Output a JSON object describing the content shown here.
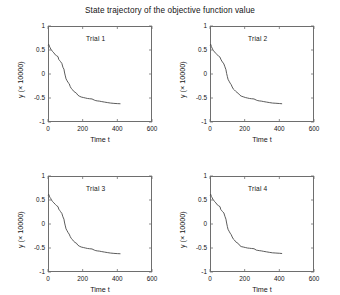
{
  "figure": {
    "title": "State trajectory of the objective function value",
    "background": "#ffffff",
    "axis_color": "#6e6e6e",
    "line_color": "#4a4a4a"
  },
  "axes": {
    "xlabel": "Time t",
    "ylabel": "y (× 10000)",
    "xticks": [
      "0",
      "200",
      "400",
      "600"
    ],
    "xtick_values": [
      0,
      200,
      400,
      600
    ],
    "yticks": [
      "1",
      "0.5",
      "0",
      "-0.5",
      "-1"
    ],
    "ytick_values": [
      1,
      0.5,
      0,
      -0.5,
      -1
    ],
    "xlim": [
      0,
      600
    ],
    "ylim": [
      -1,
      1
    ]
  },
  "chart_data": {
    "type": "line",
    "title": "State trajectory of the objective function value",
    "xlabel": "Time t",
    "ylabel": "y (× 10000)",
    "xlim": [
      0,
      600
    ],
    "ylim": [
      -1,
      1
    ],
    "grid": false,
    "legend": "none",
    "panel_layout": "2x2",
    "panels": [
      {
        "label": "Trial 1",
        "x": [
          0,
          4,
          8,
          12,
          16,
          20,
          26,
          34,
          42,
          50,
          58,
          62,
          68,
          72,
          80,
          86,
          92,
          96,
          100,
          104,
          110,
          116,
          122,
          128,
          134,
          140,
          148,
          156,
          164,
          172,
          180,
          192,
          204,
          216,
          228,
          240,
          254,
          268,
          276,
          284,
          296,
          310,
          326,
          342,
          360,
          380,
          400,
          418
        ],
        "y": [
          0.6,
          0.62,
          0.58,
          0.55,
          0.52,
          0.5,
          0.47,
          0.44,
          0.4,
          0.38,
          0.36,
          0.3,
          0.28,
          0.26,
          0.22,
          0.14,
          0.1,
          0.02,
          -0.04,
          -0.1,
          -0.14,
          -0.18,
          -0.2,
          -0.26,
          -0.3,
          -0.32,
          -0.36,
          -0.38,
          -0.4,
          -0.44,
          -0.46,
          -0.48,
          -0.49,
          -0.5,
          -0.51,
          -0.515,
          -0.52,
          -0.545,
          -0.555,
          -0.56,
          -0.565,
          -0.575,
          -0.585,
          -0.595,
          -0.605,
          -0.612,
          -0.617,
          -0.62
        ]
      },
      {
        "label": "Trial 2",
        "x": [
          0,
          4,
          8,
          12,
          16,
          20,
          26,
          34,
          42,
          50,
          58,
          62,
          68,
          72,
          80,
          86,
          92,
          96,
          100,
          104,
          110,
          116,
          122,
          128,
          134,
          140,
          148,
          156,
          164,
          172,
          180,
          192,
          204,
          216,
          228,
          240,
          254,
          268,
          276,
          284,
          296,
          310,
          326,
          342,
          360,
          380,
          400,
          416
        ],
        "y": [
          0.6,
          0.62,
          0.57,
          0.54,
          0.51,
          0.49,
          0.46,
          0.43,
          0.4,
          0.37,
          0.35,
          0.31,
          0.27,
          0.25,
          0.21,
          0.15,
          0.09,
          0.01,
          -0.05,
          -0.11,
          -0.15,
          -0.19,
          -0.22,
          -0.27,
          -0.31,
          -0.33,
          -0.36,
          -0.385,
          -0.405,
          -0.44,
          -0.46,
          -0.475,
          -0.49,
          -0.5,
          -0.51,
          -0.515,
          -0.52,
          -0.545,
          -0.555,
          -0.56,
          -0.565,
          -0.575,
          -0.585,
          -0.595,
          -0.605,
          -0.61,
          -0.615,
          -0.62
        ]
      },
      {
        "label": "Trial 3",
        "x": [
          0,
          4,
          8,
          12,
          16,
          20,
          26,
          34,
          42,
          50,
          58,
          62,
          68,
          72,
          80,
          86,
          92,
          96,
          100,
          104,
          110,
          116,
          122,
          128,
          134,
          140,
          148,
          156,
          164,
          172,
          180,
          192,
          204,
          216,
          228,
          240,
          254,
          268,
          276,
          284,
          296,
          310,
          326,
          342,
          360,
          380,
          400,
          418
        ],
        "y": [
          0.6,
          0.62,
          0.58,
          0.55,
          0.53,
          0.5,
          0.47,
          0.44,
          0.41,
          0.38,
          0.36,
          0.31,
          0.28,
          0.26,
          0.22,
          0.15,
          0.1,
          0.02,
          -0.04,
          -0.1,
          -0.14,
          -0.18,
          -0.21,
          -0.26,
          -0.3,
          -0.32,
          -0.36,
          -0.385,
          -0.4,
          -0.44,
          -0.46,
          -0.48,
          -0.49,
          -0.5,
          -0.51,
          -0.515,
          -0.52,
          -0.545,
          -0.555,
          -0.56,
          -0.565,
          -0.575,
          -0.585,
          -0.595,
          -0.605,
          -0.612,
          -0.617,
          -0.62
        ]
      },
      {
        "label": "Trial 4",
        "x": [
          0,
          4,
          8,
          12,
          16,
          20,
          26,
          34,
          42,
          50,
          58,
          62,
          68,
          72,
          80,
          86,
          92,
          96,
          100,
          104,
          110,
          116,
          122,
          128,
          134,
          140,
          148,
          156,
          164,
          172,
          180,
          192,
          204,
          216,
          228,
          240,
          254,
          268,
          276,
          284,
          296,
          310,
          326,
          342,
          360,
          380,
          400,
          416
        ],
        "y": [
          0.6,
          0.62,
          0.57,
          0.55,
          0.52,
          0.5,
          0.47,
          0.44,
          0.4,
          0.38,
          0.36,
          0.3,
          0.28,
          0.26,
          0.23,
          0.16,
          0.1,
          0.02,
          -0.05,
          -0.11,
          -0.15,
          -0.19,
          -0.22,
          -0.27,
          -0.31,
          -0.33,
          -0.37,
          -0.39,
          -0.41,
          -0.45,
          -0.47,
          -0.48,
          -0.49,
          -0.5,
          -0.505,
          -0.51,
          -0.515,
          -0.545,
          -0.55,
          -0.555,
          -0.56,
          -0.57,
          -0.58,
          -0.59,
          -0.6,
          -0.605,
          -0.61,
          -0.615
        ]
      }
    ]
  }
}
